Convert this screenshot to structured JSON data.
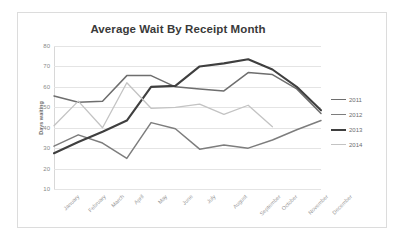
{
  "chart_data": {
    "type": "line",
    "title": "Average Wait By Receipt Month",
    "xlabel": "",
    "ylabel": "Days waiting",
    "ylim": [
      10,
      80
    ],
    "ytick_values": [
      80,
      70,
      60,
      50,
      40,
      30,
      20,
      10
    ],
    "grid": true,
    "legend_position": "right",
    "categories": [
      "January",
      "February",
      "March",
      "April",
      "May",
      "June",
      "July",
      "August",
      "September",
      "October",
      "November",
      "December"
    ],
    "series": [
      {
        "name": "2011",
        "color": "#6e6e6e",
        "width": 1.5,
        "values": [
          55.5,
          52.5,
          53,
          65.5,
          65.5,
          60,
          59,
          58,
          67,
          66,
          59,
          47
        ]
      },
      {
        "name": "2012",
        "color": "#7d7d7d",
        "width": 1.5,
        "values": [
          31,
          36.5,
          32.5,
          25,
          42.5,
          39.5,
          29.5,
          31.5,
          30,
          34,
          39,
          43.5
        ]
      },
      {
        "name": "2013",
        "color": "#3f3f3f",
        "width": 2.1,
        "values": [
          27.5,
          33,
          38,
          43.5,
          60,
          60.5,
          70,
          71.5,
          73.5,
          68.5,
          60,
          48.5
        ]
      },
      {
        "name": "2014",
        "color": "#c3c3c3",
        "width": 1.3,
        "values": [
          41,
          53,
          40,
          62,
          49.5,
          50,
          51.5,
          46.5,
          51,
          40.5,
          null,
          null
        ]
      }
    ]
  },
  "legend": {
    "entries": [
      {
        "label": "2011"
      },
      {
        "label": "2012"
      },
      {
        "label": "2013"
      },
      {
        "label": "2014"
      }
    ]
  }
}
